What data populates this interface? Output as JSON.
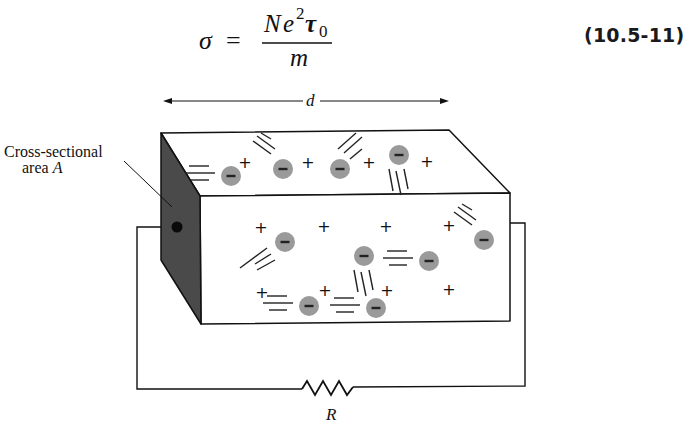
{
  "equation": {
    "lhs": "σ",
    "equals": "=",
    "numerator_N": "N",
    "numerator_e": "e",
    "numerator_e_exp": "2",
    "numerator_tau": "τ",
    "numerator_tau_sub": "0",
    "denominator": "m",
    "number": "(10.5-11)"
  },
  "figure": {
    "length_label": "d",
    "cross_section_label_line1": "Cross-sectional",
    "cross_section_label_line2_prefix": "area ",
    "cross_section_label_var": "A",
    "resistor_label": "R",
    "colors": {
      "line": "#111111",
      "cross_section_fill": "#4a4a4a",
      "electron_fill": "#9a9a9a",
      "electron_sign": "#222222",
      "background": "#ffffff"
    },
    "electron_sign": "−",
    "ion_sign": "+",
    "top_face": {
      "electrons": [
        {
          "x": 231,
          "y": 176,
          "trail": "left"
        },
        {
          "x": 283,
          "y": 169,
          "trail": "up-left"
        },
        {
          "x": 340,
          "y": 169,
          "trail": "up-right"
        },
        {
          "x": 399,
          "y": 155,
          "trail": "down"
        }
      ],
      "ions": [
        {
          "x": 245,
          "y": 163
        },
        {
          "x": 308,
          "y": 163
        },
        {
          "x": 369,
          "y": 163
        },
        {
          "x": 427,
          "y": 162
        }
      ]
    },
    "front_face": {
      "electrons": [
        {
          "x": 285,
          "y": 242,
          "trail": "down-left"
        },
        {
          "x": 364,
          "y": 256,
          "trail": "down"
        },
        {
          "x": 429,
          "y": 261,
          "trail": "left"
        },
        {
          "x": 484,
          "y": 240,
          "trail": "up-left"
        },
        {
          "x": 309,
          "y": 306,
          "trail": "left"
        },
        {
          "x": 376,
          "y": 308,
          "trail": "left"
        }
      ],
      "ions": [
        {
          "x": 261,
          "y": 228
        },
        {
          "x": 324,
          "y": 227
        },
        {
          "x": 386,
          "y": 227
        },
        {
          "x": 449,
          "y": 226
        },
        {
          "x": 262,
          "y": 293
        },
        {
          "x": 325,
          "y": 291
        },
        {
          "x": 387,
          "y": 291
        },
        {
          "x": 449,
          "y": 290
        }
      ]
    }
  }
}
